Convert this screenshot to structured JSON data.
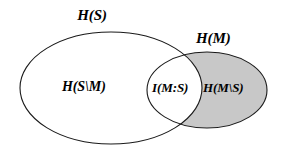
{
  "diagram": {
    "type": "venn",
    "colors": {
      "stroke": "#1a1a1a",
      "shaded_fill": "#c8c8c8",
      "plain_fill": "#ffffff",
      "background": "#ffffff",
      "text": "#000000"
    },
    "sets": [
      {
        "name": "source-entropy-ellipse",
        "label": "H(S)",
        "shape": "ellipse",
        "cx": 111,
        "cy": 88,
        "rx": 91,
        "ry": 56,
        "fill": "#ffffff"
      },
      {
        "name": "message-entropy-ellipse",
        "label": "H(M)",
        "shape": "ellipse",
        "cx": 207,
        "cy": 90,
        "rx": 60,
        "ry": 38,
        "fill": "#c8c8c8"
      }
    ],
    "labels": {
      "outer_source": "H(S)",
      "outer_message": "H(M)",
      "source_only": "H(S\\M)",
      "mutual_information": "I(M:S)",
      "message_only": "H(M\\S)"
    },
    "regions": [
      {
        "name": "source-conditional-region",
        "label": "H(S\\M)",
        "shaded": false,
        "description": "part of H(S) outside H(M)"
      },
      {
        "name": "mutual-information-region",
        "label": "I(M:S)",
        "shaded": false,
        "description": "intersection of H(S) and H(M)"
      },
      {
        "name": "message-conditional-region",
        "label": "H(M\\S)",
        "shaded": true,
        "description": "part of H(M) outside H(S)"
      }
    ]
  }
}
